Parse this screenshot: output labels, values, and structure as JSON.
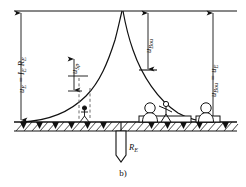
{
  "figure": {
    "caption": "b)"
  },
  "labels": {
    "earth_potential_rise": {
      "text": "uE = IE RE",
      "symbol": "u",
      "sub": "E",
      "equals": "=",
      "current": "I",
      "current_sub": "E",
      "resistance": "R",
      "resistance_sub": "E"
    },
    "step_voltage": {
      "text": "uSp",
      "symbol": "u",
      "sub": "Sp"
    },
    "touch_voltage": {
      "text": "uBou",
      "symbol": "u",
      "sub": "Bou"
    },
    "touch_voltage_right": {
      "text": "uBou = uE",
      "symbol": "u",
      "sub": "Bou",
      "equals": "=",
      "symbol2": "u",
      "sub2": "E"
    },
    "earth_resistance": {
      "text": "RE",
      "symbol": "R",
      "sub": "E"
    }
  },
  "elements": {
    "reference_line": "top-datum-line",
    "potential_curve": "earth-surface-potential-curve",
    "ground_line": "soil-surface-hatched",
    "electrode": "vertical-rod-earth-electrode",
    "person_step": "stick-figure-step-voltage",
    "person_touch": "person-touching-grounded-structure",
    "person_remote": "person-on-remote-grounded-platform",
    "dashed_markers": "step-width-dashed-lines"
  },
  "colors": {
    "ink": "#111111",
    "background": "#ffffff",
    "hatch": "#1a1a1a",
    "dashed": "#6a6a6a"
  }
}
